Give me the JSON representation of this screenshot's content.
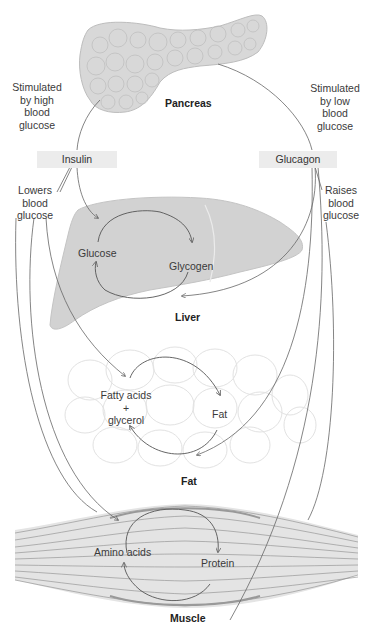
{
  "diagram": {
    "organs": {
      "pancreas": "Pancreas",
      "liver": "Liver",
      "fat": "Fat",
      "muscle": "Muscle"
    },
    "hormones": {
      "insulin": "Insulin",
      "glucagon": "Glucagon"
    },
    "stimulus": {
      "insulin": [
        "Stimulated",
        "by high",
        "blood",
        "glucose"
      ],
      "glucagon": [
        "Stimulated",
        "by low",
        "blood",
        "glucose"
      ]
    },
    "effects": {
      "insulin": [
        "Lowers",
        "blood",
        "glucose"
      ],
      "glucagon": [
        "Raises",
        "blood",
        "glucose"
      ]
    },
    "cycles": {
      "liver": {
        "left": "Glucose",
        "right": "Glycogen"
      },
      "fat": {
        "left_line1": "Fatty acids",
        "left_plus": "+",
        "left_line2": "glycerol",
        "right": "Fat"
      },
      "muscle": {
        "left": "Amino acids",
        "right": "Protein"
      }
    },
    "colors": {
      "organ_fill": "#d6d6d6",
      "liver_fill": "#cfcfcf",
      "hormone_box": "#ececec",
      "line": "#555555"
    }
  }
}
